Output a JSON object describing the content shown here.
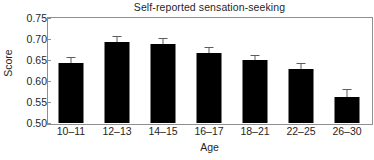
{
  "chart_data": {
    "type": "bar",
    "title": "Self-reported sensation-seeking",
    "xlabel": "Age",
    "ylabel": "Score",
    "categories": [
      "10–11",
      "12–13",
      "14–15",
      "16–17",
      "18–21",
      "22–25",
      "26–30"
    ],
    "values": [
      0.642,
      0.694,
      0.689,
      0.667,
      0.65,
      0.629,
      0.563
    ],
    "errors": [
      0.016,
      0.013,
      0.014,
      0.014,
      0.013,
      0.015,
      0.017
    ],
    "error_type": "standard error (upper whisker shown)",
    "ylim": [
      0.5,
      0.75
    ],
    "yticks": [
      "0.75",
      "0.70",
      "0.65",
      "0.60",
      "0.55",
      "0.50"
    ],
    "ytick_values": [
      0.75,
      0.7,
      0.65,
      0.6,
      0.55,
      0.5
    ],
    "grid": false,
    "legend": "none",
    "bar_color": "#000000",
    "error_bar_color": "#5d5d5d",
    "frame_color": "#8f8f8f",
    "background": "#ffffff"
  }
}
